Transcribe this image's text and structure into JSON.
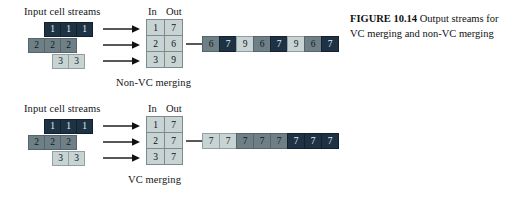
{
  "figure": {
    "caption_bold": "FIGURE 10.14",
    "caption_text": "Output streams for VC merging and non-VC merging"
  },
  "colors": {
    "dark": "#1d3245",
    "mid": "#6e8086",
    "light": "#c8d3d4",
    "table_bg": "#c8d3d4",
    "border": "#7e8a8e",
    "text": "#111111",
    "background": "#ffffff"
  },
  "panels": [
    {
      "id": "non-vc",
      "input_label": "Input cell streams",
      "col_head_in": "In",
      "col_head_out": "Out",
      "bottom_label": "Non-VC merging",
      "input_streams": [
        {
          "tone": "dark",
          "values": [
            "1",
            "1",
            "1"
          ]
        },
        {
          "tone": "mid",
          "values": [
            "2",
            "2",
            "2"
          ]
        },
        {
          "tone": "light",
          "values": [
            "3",
            "3"
          ]
        }
      ],
      "table_rows": [
        {
          "in": "1",
          "out": "7"
        },
        {
          "in": "2",
          "out": "6"
        },
        {
          "in": "3",
          "out": "9"
        }
      ],
      "output_stream": [
        {
          "value": "6",
          "tone": "mid"
        },
        {
          "value": "7",
          "tone": "dark"
        },
        {
          "value": "9",
          "tone": "light"
        },
        {
          "value": "6",
          "tone": "mid"
        },
        {
          "value": "7",
          "tone": "dark"
        },
        {
          "value": "9",
          "tone": "light"
        },
        {
          "value": "6",
          "tone": "mid"
        },
        {
          "value": "7",
          "tone": "dark"
        }
      ]
    },
    {
      "id": "vc",
      "input_label": "Input cell streams",
      "col_head_in": "In",
      "col_head_out": "Out",
      "bottom_label": "VC merging",
      "input_streams": [
        {
          "tone": "dark",
          "values": [
            "1",
            "1",
            "1"
          ]
        },
        {
          "tone": "mid",
          "values": [
            "2",
            "2",
            "2"
          ]
        },
        {
          "tone": "light",
          "values": [
            "3",
            "3"
          ]
        }
      ],
      "table_rows": [
        {
          "in": "1",
          "out": "7"
        },
        {
          "in": "2",
          "out": "7"
        },
        {
          "in": "3",
          "out": "7"
        }
      ],
      "output_stream": [
        {
          "value": "7",
          "tone": "light"
        },
        {
          "value": "7",
          "tone": "light"
        },
        {
          "value": "7",
          "tone": "mid"
        },
        {
          "value": "7",
          "tone": "mid"
        },
        {
          "value": "7",
          "tone": "mid"
        },
        {
          "value": "7",
          "tone": "dark"
        },
        {
          "value": "7",
          "tone": "dark"
        },
        {
          "value": "7",
          "tone": "dark"
        }
      ]
    }
  ]
}
